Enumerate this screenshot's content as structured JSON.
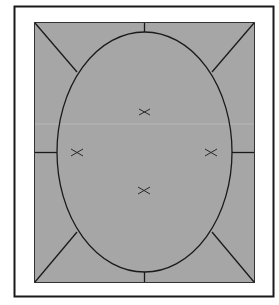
{
  "diagram": {
    "colors": {
      "background": "#ffffff",
      "frame_stroke": "#1a1a1a",
      "panel_fill": "#a6a6a6",
      "line": "#1a1a1a"
    },
    "marks": [
      {
        "id": "top",
        "symbol": "x"
      },
      {
        "id": "left",
        "symbol": "x"
      },
      {
        "id": "right",
        "symbol": "x"
      },
      {
        "id": "bottom",
        "symbol": "x"
      }
    ]
  }
}
